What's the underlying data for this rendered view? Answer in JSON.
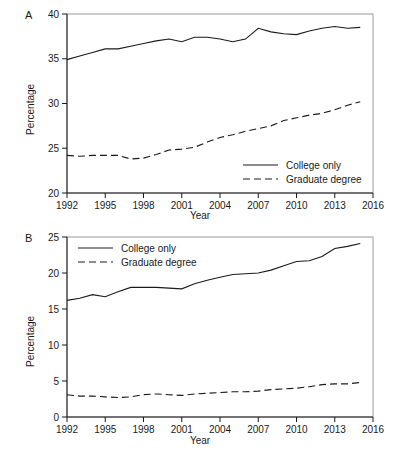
{
  "figure": {
    "panels": [
      {
        "letter": "A",
        "ylabel": "Percentage",
        "xlabel": "Year",
        "legend_position": "bottom-right",
        "legend": [
          {
            "label": "College only",
            "style": "solid"
          },
          {
            "label": "Graduate degree",
            "style": "dashed"
          }
        ],
        "ytick_labels": [
          "20",
          "25",
          "30",
          "35",
          "40"
        ],
        "xtick_labels": [
          "1992",
          "1995",
          "1998",
          "2001",
          "2004",
          "2007",
          "2010",
          "2013",
          "2016"
        ]
      },
      {
        "letter": "B",
        "ylabel": "Percentage",
        "xlabel": "Year",
        "legend_position": "top-left",
        "legend": [
          {
            "label": "College only",
            "style": "solid"
          },
          {
            "label": "Graduate degree",
            "style": "dashed"
          }
        ],
        "ytick_labels": [
          "0",
          "5",
          "10",
          "15",
          "20",
          "25"
        ],
        "xtick_labels": [
          "1992",
          "1995",
          "1998",
          "2001",
          "2004",
          "2007",
          "2010",
          "2013",
          "2016"
        ]
      }
    ]
  },
  "chart_data": [
    {
      "type": "line",
      "panel": "A",
      "title": "",
      "xlabel": "Year",
      "ylabel": "Percentage",
      "xlim": [
        1992,
        2016
      ],
      "ylim": [
        20,
        40
      ],
      "yticks": [
        20,
        25,
        30,
        35,
        40
      ],
      "xticks": [
        1992,
        1995,
        1998,
        2001,
        2004,
        2007,
        2010,
        2013,
        2016
      ],
      "grid": false,
      "legend_position": "lower right",
      "x": [
        1992,
        1993,
        1994,
        1995,
        1996,
        1997,
        1998,
        1999,
        2000,
        2001,
        2002,
        2003,
        2004,
        2005,
        2006,
        2007,
        2008,
        2009,
        2010,
        2011,
        2012,
        2013,
        2014,
        2015
      ],
      "series": [
        {
          "name": "College only",
          "style": "solid",
          "values": [
            34.9,
            35.3,
            35.7,
            36.1,
            36.1,
            36.4,
            36.7,
            37.0,
            37.2,
            36.9,
            37.4,
            37.4,
            37.2,
            36.9,
            37.2,
            38.4,
            38.0,
            37.8,
            37.7,
            38.1,
            38.4,
            38.6,
            38.4,
            38.5
          ]
        },
        {
          "name": "Graduate degree",
          "style": "dashed",
          "values": [
            24.2,
            24.1,
            24.2,
            24.2,
            24.2,
            23.8,
            23.9,
            24.3,
            24.8,
            24.9,
            25.1,
            25.7,
            26.2,
            26.5,
            26.9,
            27.2,
            27.5,
            28.1,
            28.4,
            28.7,
            28.9,
            29.3,
            29.8,
            30.2
          ]
        }
      ]
    },
    {
      "type": "line",
      "panel": "B",
      "title": "",
      "xlabel": "Year",
      "ylabel": "Percentage",
      "xlim": [
        1992,
        2016
      ],
      "ylim": [
        0,
        25
      ],
      "yticks": [
        0,
        5,
        10,
        15,
        20,
        25
      ],
      "xticks": [
        1992,
        1995,
        1998,
        2001,
        2004,
        2007,
        2010,
        2013,
        2016
      ],
      "grid": false,
      "legend_position": "upper left",
      "x": [
        1992,
        1993,
        1994,
        1995,
        1996,
        1997,
        1998,
        1999,
        2000,
        2001,
        2002,
        2003,
        2004,
        2005,
        2006,
        2007,
        2008,
        2009,
        2010,
        2011,
        2012,
        2013,
        2014,
        2015
      ],
      "series": [
        {
          "name": "College only",
          "style": "solid",
          "values": [
            16.2,
            16.5,
            17.0,
            16.7,
            17.4,
            18.0,
            18.0,
            18.0,
            17.9,
            17.8,
            18.5,
            19.0,
            19.4,
            19.8,
            19.9,
            20.0,
            20.4,
            21.0,
            21.6,
            21.7,
            22.3,
            23.4,
            23.7,
            24.1
          ]
        },
        {
          "name": "Graduate degree",
          "style": "dashed",
          "values": [
            3.1,
            2.9,
            2.9,
            2.8,
            2.7,
            2.8,
            3.1,
            3.2,
            3.1,
            3.0,
            3.2,
            3.3,
            3.4,
            3.5,
            3.5,
            3.6,
            3.8,
            3.9,
            4.0,
            4.2,
            4.5,
            4.6,
            4.6,
            4.8
          ]
        }
      ]
    }
  ]
}
